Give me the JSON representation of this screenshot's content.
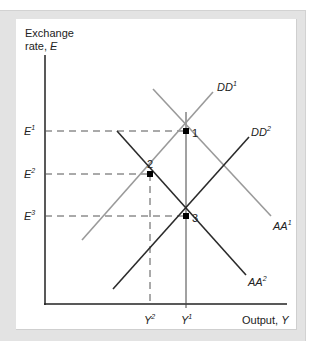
{
  "diagram": {
    "y_axis_label_line1": "Exchange",
    "y_axis_label_line2_prefix": "rate, ",
    "y_axis_label_var": "E",
    "x_axis_label_prefix": "Output, ",
    "x_axis_label_var": "Y",
    "y_ticks": [
      {
        "base": "E",
        "sup": "1",
        "level": "E1"
      },
      {
        "base": "E",
        "sup": "2",
        "level": "E2"
      },
      {
        "base": "E",
        "sup": "3",
        "level": "E3"
      }
    ],
    "x_ticks": [
      {
        "base": "Y",
        "sup": "2",
        "level": "Y2"
      },
      {
        "base": "Y",
        "sup": "1",
        "level": "Y1"
      }
    ],
    "curves": [
      {
        "id": "DD1",
        "base": "DD",
        "sup": "1",
        "shade": "light",
        "color": "#9a9a9a"
      },
      {
        "id": "DD2",
        "base": "DD",
        "sup": "2",
        "shade": "dark",
        "color": "#2b2b2b"
      },
      {
        "id": "AA1",
        "base": "AA",
        "sup": "1",
        "shade": "light",
        "color": "#9a9a9a"
      },
      {
        "id": "AA2",
        "base": "AA",
        "sup": "2",
        "shade": "dark",
        "color": "#2b2b2b"
      }
    ],
    "equilibria": [
      {
        "label": "1",
        "at": [
          "Y1",
          "E1"
        ],
        "on": [
          "DD1",
          "AA1"
        ]
      },
      {
        "label": "2",
        "at": [
          "Y2",
          "E2"
        ],
        "on": [
          "DD1",
          "AA2"
        ]
      },
      {
        "label": "3",
        "at": [
          "Y1",
          "E3"
        ],
        "on": [
          "DD2",
          "AA2"
        ]
      }
    ],
    "colors": {
      "frame": "#e3e3e3",
      "axis": "#222222",
      "dashed": "#555555",
      "light_curve": "#9a9a9a",
      "dark_curve": "#2b2b2b"
    }
  }
}
